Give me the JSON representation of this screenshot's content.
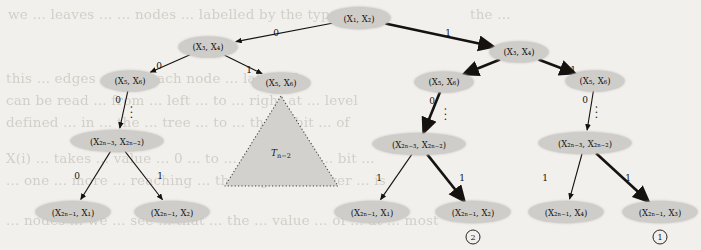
{
  "figure": {
    "kind": "binary-decision-tree",
    "title": "",
    "node_fill": "#cfcdc9",
    "edge_color": "#15120f",
    "background": "#f2f0ec",
    "nodes": [
      {
        "id": "root",
        "label": "(X₁, X₂)",
        "x": 359,
        "y": 18,
        "w": 62,
        "h": 21
      },
      {
        "id": "L1",
        "label": "(X₃, X₄)",
        "x": 208,
        "y": 47,
        "w": 58,
        "h": 20
      },
      {
        "id": "R1",
        "label": "(X₃, X₄)",
        "x": 519,
        "y": 52,
        "w": 58,
        "h": 20
      },
      {
        "id": "LL2",
        "label": "(X₅, X₆)",
        "x": 130,
        "y": 81,
        "w": 58,
        "h": 20
      },
      {
        "id": "LR2",
        "label": "(X₅, X₆)",
        "x": 281,
        "y": 83,
        "w": 58,
        "h": 20
      },
      {
        "id": "RL2",
        "label": "(X₅, X₆)",
        "x": 444,
        "y": 82,
        "w": 58,
        "h": 20
      },
      {
        "id": "RR2",
        "label": "(X₅, X₆)",
        "x": 595,
        "y": 81,
        "w": 58,
        "h": 20
      },
      {
        "id": "L3",
        "label": "(X₂ₙ₋₃, X₂ₙ₋₂)",
        "x": 117,
        "y": 141,
        "w": 92,
        "h": 21
      },
      {
        "id": "R3",
        "label": "(X₂ₙ₋₃, X₂ₙ₋₂)",
        "x": 419,
        "y": 144,
        "w": 92,
        "h": 21
      },
      {
        "id": "RR3",
        "label": "(X₂ₙ₋₃, X₂ₙ₋₂)",
        "x": 585,
        "y": 143,
        "w": 92,
        "h": 21
      },
      {
        "id": "leaf1",
        "label": "(X₂ₙ₋₁, X₁)",
        "x": 73,
        "y": 212,
        "w": 74,
        "h": 21
      },
      {
        "id": "leaf2",
        "label": "(X₂ₙ₋₁, X₂)",
        "x": 172,
        "y": 212,
        "w": 74,
        "h": 21
      },
      {
        "id": "leaf3",
        "label": "(X₂ₙ₋₁, X₁)",
        "x": 372,
        "y": 212,
        "w": 74,
        "h": 21
      },
      {
        "id": "leaf4",
        "label": "(X₂ₙ₋₁, X₂)",
        "x": 473,
        "y": 212,
        "w": 74,
        "h": 21
      },
      {
        "id": "leaf5",
        "label": "(X₂ₙ₋₁, X₄)",
        "x": 566,
        "y": 212,
        "w": 74,
        "h": 21
      },
      {
        "id": "leaf6",
        "label": "(X₂ₙ₋₁, X₃)",
        "x": 660,
        "y": 212,
        "w": 74,
        "h": 21
      }
    ],
    "edges": [
      {
        "from": "root",
        "to": "L1",
        "label": "0",
        "lx": 276,
        "ly": 33,
        "bold": false
      },
      {
        "from": "root",
        "to": "R1",
        "label": "1",
        "lx": 448,
        "ly": 33,
        "bold": true
      },
      {
        "from": "L1",
        "to": "LL2",
        "label": "0",
        "lx": 159,
        "ly": 66,
        "bold": false
      },
      {
        "from": "L1",
        "to": "LR2",
        "label": "1",
        "lx": 249,
        "ly": 70,
        "bold": false
      },
      {
        "from": "R1",
        "to": "RL2",
        "label": "0",
        "lx": 472,
        "ly": 69,
        "bold": true
      },
      {
        "from": "R1",
        "to": "RR2",
        "label": "1",
        "lx": 573,
        "ly": 70,
        "bold": true
      },
      {
        "from": "LL2",
        "to": "L3",
        "label": "0",
        "lx": 118,
        "ly": 100,
        "bold": false
      },
      {
        "from": "RL2",
        "to": "R3",
        "label": "0",
        "lx": 432,
        "ly": 101,
        "bold": true
      },
      {
        "from": "RR2",
        "to": "RR3",
        "label": "0",
        "lx": 585,
        "ly": 100,
        "bold": false
      },
      {
        "from": "L3",
        "to": "leaf1",
        "label": "0",
        "lx": 77,
        "ly": 176,
        "bold": false
      },
      {
        "from": "L3",
        "to": "leaf2",
        "label": "1",
        "lx": 160,
        "ly": 176,
        "bold": false
      },
      {
        "from": "R3",
        "to": "leaf3",
        "label": "1",
        "lx": 379,
        "ly": 178,
        "bold": false
      },
      {
        "from": "R3",
        "to": "leaf4",
        "label": "1",
        "lx": 462,
        "ly": 178,
        "bold": true
      },
      {
        "from": "RR3",
        "to": "leaf5",
        "label": "1",
        "lx": 545,
        "ly": 178,
        "bold": false
      },
      {
        "from": "RR3",
        "to": "leaf6",
        "label": "1",
        "lx": 628,
        "ly": 178,
        "bold": true
      }
    ],
    "vertical_dots": [
      {
        "x": 130,
        "y": 113
      },
      {
        "x": 444,
        "y": 115
      },
      {
        "x": 595,
        "y": 113
      }
    ],
    "subtree": {
      "label": "T",
      "label_sub": "n−2",
      "apex_x": 281,
      "apex_y": 96,
      "base_left_x": 225,
      "base_right_x": 338,
      "base_y": 186
    },
    "markers": [
      {
        "text": "2",
        "x": 473,
        "y": 237
      },
      {
        "text": "1",
        "x": 660,
        "y": 237
      }
    ]
  },
  "bleed_text": [
    {
      "text": "we ... leaves ...  ... nodes ... labelled by the type ... as",
      "x": 8,
      "y": 6
    },
    {
      "text": "the ...",
      "x": 470,
      "y": 6
    },
    {
      "text": "this ... edges ... and each node ... labelled",
      "x": 6,
      "y": 70
    },
    {
      "text": "can be read ... from ... left ... to ... right at ... level",
      "x": 6,
      "y": 92
    },
    {
      "text": "defined ... in ... the ... tree ... to ... the ... bit ... of",
      "x": 6,
      "y": 114
    },
    {
      "text": "X(i) ... takes ... value ... 0 ... to ... rate ... the ... bit ...",
      "x": 6,
      "y": 150
    },
    {
      "text": "... one ... more ... reaching ... the ... given ... over ... is",
      "x": 6,
      "y": 172
    },
    {
      "text": "... nodes ... we ... see ... that ... the ... value ... of ... at ... most",
      "x": 6,
      "y": 212
    }
  ]
}
